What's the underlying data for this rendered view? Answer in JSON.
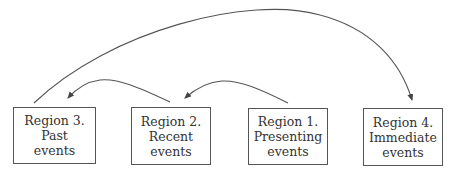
{
  "diagram": {
    "colors": {
      "stroke": "#555555",
      "text": "#333333",
      "background": "#ffffff"
    },
    "regions": [
      {
        "id": "region-3",
        "lines": [
          "Region 3.",
          "Past",
          "events"
        ]
      },
      {
        "id": "region-2",
        "lines": [
          "Region 2.",
          "Recent",
          "events"
        ]
      },
      {
        "id": "region-1",
        "lines": [
          "Region 1.",
          "Presenting",
          "events"
        ]
      },
      {
        "id": "region-4",
        "lines": [
          "Region 4.",
          "Immediate",
          "events"
        ]
      }
    ],
    "arrows": [
      {
        "from": "Region 2",
        "to": "Region 3"
      },
      {
        "from": "Region 1",
        "to": "Region 2"
      },
      {
        "from": "Region 3",
        "to": "Region 4"
      }
    ]
  }
}
